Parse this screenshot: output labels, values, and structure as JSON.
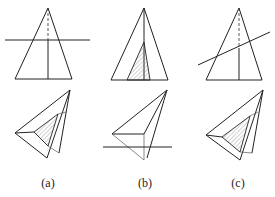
{
  "figure": {
    "panels": [
      {
        "id": "a",
        "label": "(a)",
        "description": "Cone cut by a horizontal plane perpendicular to axis; plan view shows hatched similar triangle section"
      },
      {
        "id": "b",
        "label": "(b)",
        "description": "Cone cut by a plane through the apex; front view shows hatched triangular section; plan view with horizontal cut line"
      },
      {
        "id": "c",
        "label": "(c)",
        "description": "Cone cut by an oblique plane; plan view shows hatched section"
      }
    ]
  },
  "colors": {
    "line": "#222222",
    "hatch": "#666666",
    "background": "#ffffff"
  }
}
